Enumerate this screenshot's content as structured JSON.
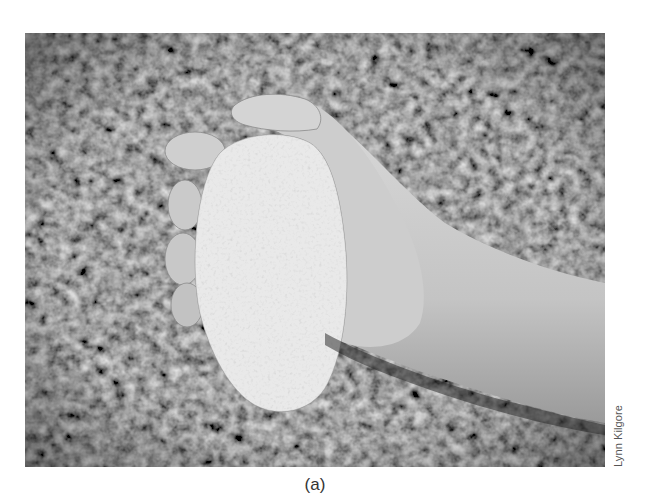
{
  "figure": {
    "photo_description": "Grayscale photograph of a hand gripping a large rough rock against a grass background",
    "photo_credit": "Lynn Kilgore",
    "caption_label": "(a)"
  },
  "colors": {
    "grass_dark": "#2b2b2b",
    "grass_mid": "#5a5a5a",
    "skin": "#c9c9c9",
    "rock": "#d2d2d2",
    "text": "#333333"
  }
}
